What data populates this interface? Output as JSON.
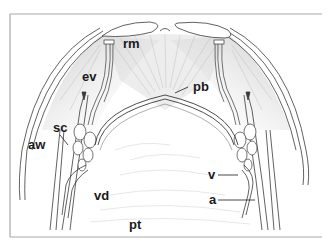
{
  "figure": {
    "type": "anatomical line drawing",
    "frame_color": "#a8a8a8",
    "line_color": "#3a3a3a",
    "shade_color": "#bdbdbd"
  },
  "labels": {
    "rm": "rm",
    "ev": "ev",
    "pb": "pb",
    "sc": "sc",
    "aw": "aw",
    "vd": "vd",
    "v": "v",
    "a": "a",
    "pt": "pt"
  }
}
